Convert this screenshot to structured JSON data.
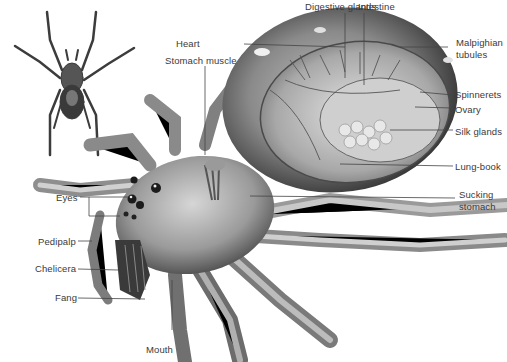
{
  "diagram": {
    "labels": {
      "digestive_glands": "Digestive glands",
      "intestine": "Intestine",
      "heart": "Heart",
      "stomach_muscle": "Stomach muscle",
      "malpighian_tubules_1": "Malpighian",
      "malpighian_tubules_2": "tubules",
      "spinnerets": "Spinnerets",
      "ovary": "Ovary",
      "silk_glands": "Silk glands",
      "lung_book": "Lung-book",
      "sucking_stomach_1": "Sucking",
      "sucking_stomach_2": "stomach",
      "eyes": "Eyes",
      "pedipalp": "Pedipalp",
      "chelicera": "Chelicera",
      "fang": "Fang",
      "mouth": "Mouth"
    },
    "colors": {
      "background": "#ffffff",
      "label_text": "#3a3a3a",
      "leader_line": "#444444"
    }
  }
}
